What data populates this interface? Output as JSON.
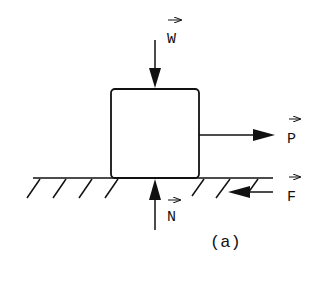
{
  "diagram": {
    "caption": "(a)",
    "block": {
      "label": "block"
    },
    "surface": {
      "label": "ground"
    },
    "forces": [
      {
        "id": "W",
        "label": "W",
        "vector": true,
        "direction": "down",
        "description": "weight"
      },
      {
        "id": "P",
        "label": "P",
        "vector": true,
        "direction": "right",
        "description": "applied force"
      },
      {
        "id": "N",
        "label": "N",
        "vector": true,
        "direction": "up",
        "description": "normal force"
      },
      {
        "id": "F",
        "label": "F",
        "vector": true,
        "direction": "left",
        "description": "friction force"
      }
    ],
    "colors": {
      "ink": "#111111",
      "background": "#ffffff"
    }
  }
}
